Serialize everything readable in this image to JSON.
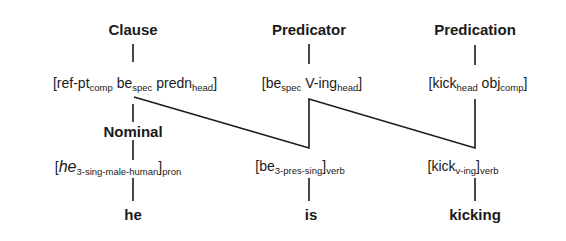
{
  "categories": {
    "clause": "Clause",
    "predicator": "Predicator",
    "predication": "Predication",
    "nominal": "Nominal"
  },
  "clause_features": [
    {
      "base": "[ref-pt",
      "sub": "comp"
    },
    {
      "base": " be",
      "sub": "spec"
    },
    {
      "base": " predn",
      "sub": "head"
    },
    {
      "base": "]",
      "sub": ""
    }
  ],
  "predicator_features": [
    {
      "base": "[be",
      "sub": "spec"
    },
    {
      "base": " V-ing",
      "sub": "head"
    },
    {
      "base": "]",
      "sub": ""
    }
  ],
  "predication_features": [
    {
      "base": "[kick",
      "sub": "head"
    },
    {
      "base": " obj",
      "sub": "comp"
    },
    {
      "base": "]",
      "sub": ""
    }
  ],
  "pronoun_feature": {
    "open": "[",
    "base": "he",
    "sub": "3-sing-male-human",
    "close": "]",
    "post_sub": "pron"
  },
  "verb_be_feature": {
    "open": "[",
    "base": "be",
    "sub": "3-pres-sing",
    "close": "]",
    "post_sub": "verb"
  },
  "verb_kick_feature": {
    "open": "[",
    "base": "kick",
    "sub": "v-ing",
    "close": "]",
    "post_sub": "verb"
  },
  "words": {
    "he": "he",
    "is": "is",
    "kicking": "kicking"
  }
}
